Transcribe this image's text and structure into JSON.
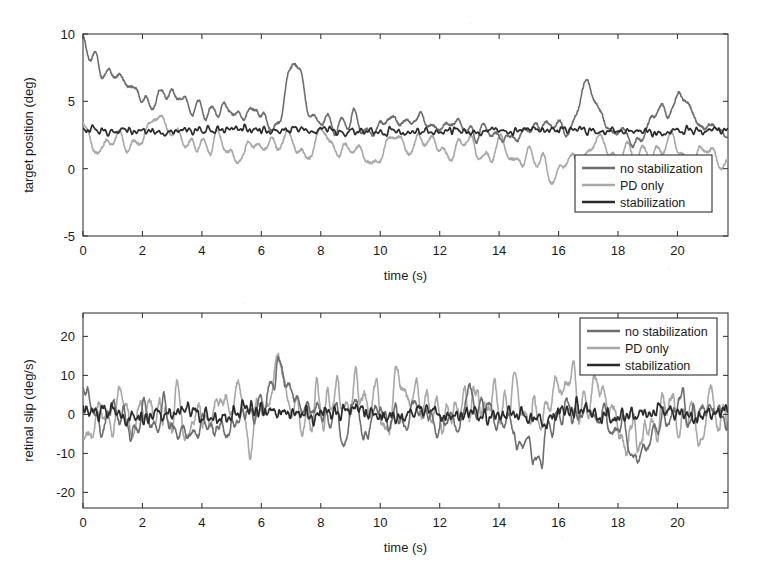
{
  "figure": {
    "kind": "two-panel-time-series",
    "background": "#ffffff"
  },
  "series_styles": {
    "no_stabilization": {
      "label": "no stabilization",
      "color": "#6e6e6e",
      "width": 1.6
    },
    "pd_only": {
      "label": "PD only",
      "color": "#a8a8a8",
      "width": 1.6
    },
    "stabilization": {
      "label": "stabilization",
      "color": "#2b2b2b",
      "width": 1.7
    }
  },
  "chart_data": [
    {
      "type": "line",
      "id": "target-position",
      "title": "",
      "xlabel": "time (s)",
      "ylabel": "target position (deg)",
      "xlim": [
        0,
        21.7
      ],
      "ylim": [
        -5,
        10
      ],
      "xticks": [
        0,
        2,
        4,
        6,
        8,
        10,
        12,
        14,
        16,
        18,
        20
      ],
      "xticklabels": [
        "0",
        "2",
        "4",
        "6",
        "8",
        "10",
        "12",
        "14",
        "16",
        "18",
        "20"
      ],
      "yticks": [
        -5,
        0,
        5,
        10
      ],
      "yticklabels": [
        "-5",
        "0",
        "5",
        "10"
      ],
      "grid": false,
      "legend_position": "lower right",
      "legend_entries": [
        "no stabilization",
        "PD only",
        "stabilization"
      ],
      "series": [
        {
          "name": "no stabilization",
          "color": "#6e6e6e",
          "description": "starts near 9-10 deg, decays over first 3 s toward a 2-4 deg band, then oscillates 1-7 deg",
          "mean_level": 3.0,
          "start_value": 9.0,
          "decay_time_s": 3.0,
          "base_amplitude": 1.5,
          "seed": 17,
          "freq_hz": [
            0.9,
            2.3,
            3.7
          ],
          "envelope_events": [
            {
              "t": 7.15,
              "amp": 4.3
            },
            {
              "t": 17.0,
              "amp": 3.2
            },
            {
              "t": 20.0,
              "amp": 2.4
            }
          ]
        },
        {
          "name": "PD only",
          "color": "#a8a8a8",
          "description": "oscillates about 1.5 deg with dips to 0 and peaks to 5; a deep trough near 15-16.5 s",
          "mean_level": 1.6,
          "start_value": 2.4,
          "decay_time_s": 0,
          "base_amplitude": 1.7,
          "seed": 41,
          "freq_hz": [
            0.85,
            2.1,
            3.3
          ],
          "envelope_events": [
            {
              "t": 2.7,
              "amp": 1.6
            },
            {
              "t": 15.9,
              "amp": -2.0
            },
            {
              "t": 21.2,
              "amp": -1.4
            }
          ]
        },
        {
          "name": "stabilization",
          "color": "#2b2b2b",
          "description": "nearly flat at 2.8 deg with small ripple of about 0.45 deg",
          "mean_level": 2.8,
          "start_value": 2.8,
          "decay_time_s": 0,
          "base_amplitude": 0.42,
          "seed": 73,
          "freq_hz": [
            3.1,
            6.4,
            9.2
          ],
          "envelope_events": []
        }
      ]
    },
    {
      "type": "line",
      "id": "retinal-slip",
      "title": "",
      "xlabel": "time (s)",
      "ylabel": "retinal slip (deg/s)",
      "xlim": [
        0,
        21.7
      ],
      "ylim": [
        -24,
        26
      ],
      "xticks": [
        0,
        2,
        4,
        6,
        8,
        10,
        12,
        14,
        16,
        18,
        20
      ],
      "xticklabels": [
        "0",
        "2",
        "4",
        "6",
        "8",
        "10",
        "12",
        "14",
        "16",
        "18",
        "20"
      ],
      "yticks": [
        -20,
        -10,
        0,
        10,
        20
      ],
      "yticklabels": [
        "-20",
        "-10",
        "0",
        "10",
        "20"
      ],
      "grid": false,
      "legend_position": "upper right",
      "legend_entries": [
        "no stabilization",
        "PD only",
        "stabilization"
      ],
      "series": [
        {
          "name": "no stabilization",
          "color": "#6e6e6e",
          "description": "rapid oscillation about 0 deg/s, typical peaks plus or minus 10, occasional plus or minus 18",
          "mean_level": 0,
          "start_value": 11.0,
          "decay_time_s": 0,
          "base_amplitude": 7.5,
          "seed": 103,
          "freq_hz": [
            1.55,
            3.1,
            6.2
          ],
          "envelope_events": [
            {
              "t": 6.6,
              "amp": 9.0
            },
            {
              "t": 15.2,
              "amp": -10.0
            },
            {
              "t": 18.6,
              "amp": -9.0
            }
          ]
        },
        {
          "name": "PD only",
          "color": "#a8a8a8",
          "description": "largest amplitude, peaks to plus 24 near 6.6 s and troughs near minus 20",
          "mean_level": 0,
          "start_value": -7.0,
          "decay_time_s": 0,
          "base_amplitude": 11.5,
          "seed": 211,
          "freq_hz": [
            1.5,
            3.0,
            5.9
          ],
          "envelope_events": [
            {
              "t": 6.55,
              "amp": 12.0
            },
            {
              "t": 9.4,
              "amp": 8.0
            },
            {
              "t": 16.0,
              "amp": 7.0
            }
          ]
        },
        {
          "name": "stabilization",
          "color": "#2b2b2b",
          "description": "low amplitude high frequency ripple within plus or minus 5 deg/s",
          "mean_level": 0,
          "start_value": 2.0,
          "decay_time_s": 0,
          "base_amplitude": 3.4,
          "seed": 307,
          "freq_hz": [
            3.2,
            6.5,
            11.0
          ],
          "envelope_events": []
        }
      ]
    }
  ]
}
